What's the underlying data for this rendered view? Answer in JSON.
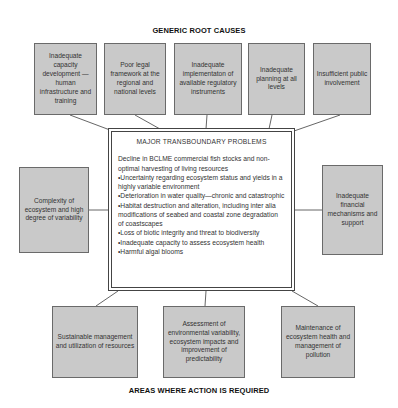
{
  "headings": {
    "top": "GENERIC ROOT CAUSES",
    "bottom": "AREAS WHERE ACTION IS REQUIRED"
  },
  "root_causes": [
    "Inadequate capacity development —human infrastructure and training",
    "Poor legal framework at the regional and national levels",
    "Inadequate implementaton of available regulatory instruments",
    "Inadequate planning at all levels",
    "Insufficient public involvement"
  ],
  "side_causes": {
    "left": "Complexity of ecosystem and high degree of variability",
    "right": "Inadequate financial mechanisms and support"
  },
  "central_problems": {
    "title": "MAJOR TRANSBOUNDARY PROBLEMS",
    "items": [
      "Decline in BCLME commercial fish stocks and non-optimal harvesting of living resources",
      "•Uncertainty regarding ecosystem status and yields in a highly variable environment",
      "•Deterioration in water quality—chronic and catastrophic",
      "•Habitat destruction and alteration, including inter alia modifications of seabed and coastal zone degradation of coastscapes",
      "•Loss of biotic integrity and threat to biodiversity",
      "•Inadequate capacity to assess ecosystem health",
      "•Harmful algal blooms"
    ]
  },
  "action_areas": [
    "Sustainable management and utilization of resources",
    "Assessment of environmental variability, ecosystem impacts and improvement of predictability",
    "Maintenance of ecosystem health and management of pollution"
  ],
  "colors": {
    "box_fill": "#c9c9c9",
    "box_border": "#6a6a6a",
    "center_border": "#444444",
    "connector": "#555555"
  }
}
